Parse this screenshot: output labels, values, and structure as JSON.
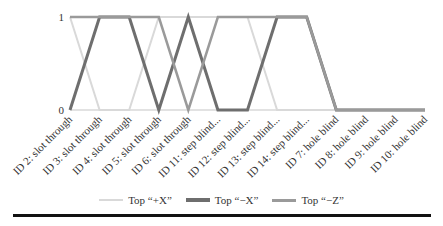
{
  "chart_data": {
    "type": "line",
    "title": "",
    "xlabel": "",
    "ylabel": "",
    "ylim": [
      0,
      1
    ],
    "yticks": [
      "0",
      "1"
    ],
    "grid": false,
    "legend_position": "bottom",
    "categories": [
      "ID 2: slot through",
      "ID 3: slot through",
      "ID 4: slot through",
      "ID 5: slot through",
      "ID 6: slot through",
      "ID 11: step blind...",
      "ID 12: step blind...",
      "ID 13: step blind...",
      "ID 14: step blind...",
      "ID 7: hole blind",
      "ID 8: hole blind",
      "ID 9: hole blind",
      "ID 10: hole blind"
    ],
    "series": [
      {
        "name": "Top “+X”",
        "color": "#d9d9d9",
        "width": 2,
        "values": [
          1,
          0,
          0,
          1,
          1,
          1,
          1,
          0,
          0,
          0,
          0,
          0,
          0
        ]
      },
      {
        "name": "Top “−X”",
        "color": "#6e6e6e",
        "width": 3,
        "values": [
          0,
          1,
          1,
          0,
          1,
          0,
          0,
          1,
          1,
          0,
          0,
          0,
          0
        ]
      },
      {
        "name": "Top “−Z”",
        "color": "#9a9a9a",
        "width": 2.5,
        "values": [
          1,
          1,
          1,
          1,
          0,
          1,
          1,
          1,
          1,
          0,
          0,
          0,
          0
        ]
      }
    ]
  }
}
